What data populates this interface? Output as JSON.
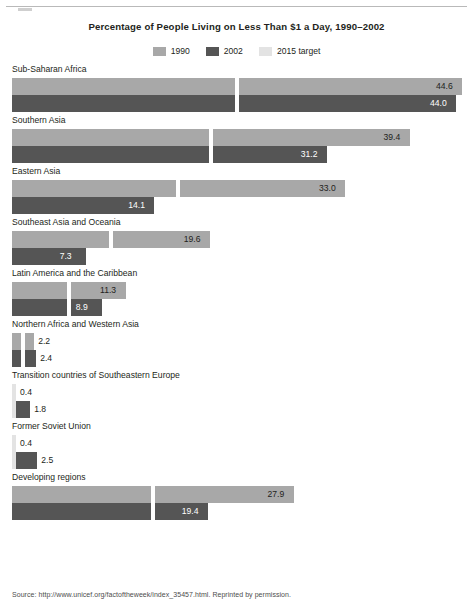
{
  "chart_data": {
    "type": "bar",
    "title": "Percentage of People Living on Less Than $1 a Day, 1990–2002",
    "xlabel": "",
    "ylabel": "",
    "orientation": "horizontal",
    "grid": false,
    "legend_position": "top-center",
    "xlim": [
      0,
      45.6
    ],
    "categories": [
      "Sub-Saharan Africa",
      "Southern Asia",
      "Eastern Asia",
      "Southeast Asia and Oceania",
      "Latin America and the Caribbean",
      "Northern Africa and Western Asia",
      "Transition countries of Southeastern Europe",
      "Former Soviet Union",
      "Developing regions"
    ],
    "series": [
      {
        "name": "1990",
        "color": "#a8a8a8",
        "values": [
          44.6,
          39.4,
          33.0,
          19.6,
          11.3,
          2.2,
          0.4,
          0.4,
          27.9
        ],
        "labels": [
          "44.6",
          "39.4",
          "33.0",
          "19.6",
          "11.3",
          "2.2",
          "0.4",
          "0.4",
          "27.9"
        ]
      },
      {
        "name": "2002",
        "color": "#555555",
        "values": [
          44.0,
          31.2,
          14.1,
          7.3,
          8.9,
          2.4,
          1.8,
          2.5,
          19.4
        ],
        "labels": [
          "44.0",
          "31.2",
          "14.1",
          "7.3",
          "8.9",
          "2.4",
          "1.8",
          "2.5",
          "19.4"
        ]
      },
      {
        "name": "2015 target",
        "color": "#e3e3e3",
        "marker": "vertical-tick",
        "values": [
          22.3,
          19.7,
          16.5,
          9.8,
          5.65,
          1.1,
          0.2,
          0.2,
          13.95
        ],
        "labels": [
          "",
          "",
          "",
          "",
          "",
          "",
          "",
          "",
          ""
        ]
      }
    ]
  },
  "legend": {
    "items": [
      {
        "label": "1990",
        "color": "#a8a8a8"
      },
      {
        "label": "2002",
        "color": "#555555"
      },
      {
        "label": "2015 target",
        "color": "#e3e3e3"
      }
    ]
  },
  "footer": {
    "source": "Source: http://www.unicef.org/factoftheweek/index_35457.html. Reprinted by permission."
  }
}
